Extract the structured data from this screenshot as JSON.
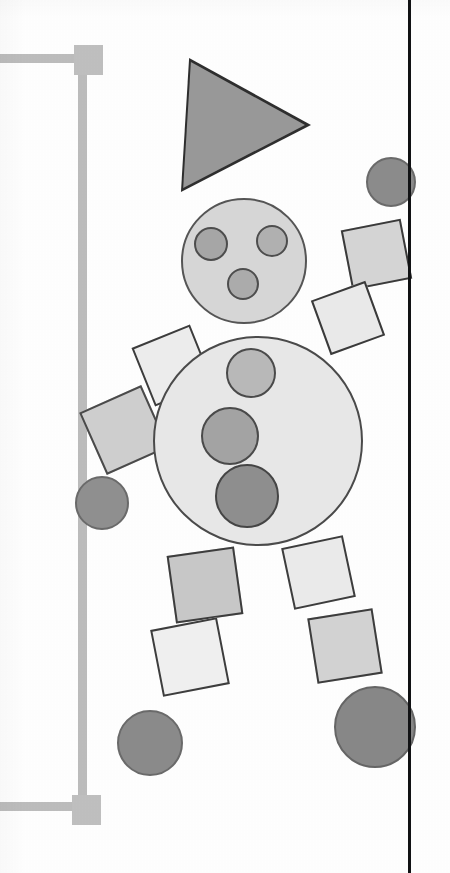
{
  "scene": {
    "title": "Geometric figure composition",
    "background_color": "#ffffff",
    "width": 450,
    "height": 873,
    "medium": "scanned line drawing"
  },
  "palette": {
    "paper": "#ffffff",
    "ink_black": "#111214",
    "outline_dark": "#3a3a3a",
    "outline_mid": "#5c5c5c",
    "gray_bracket": "#bdbdbd",
    "gray_lightest": "#eeeeee",
    "gray_light": "#e3e3e3",
    "gray_pale": "#d8d8d8",
    "gray_mid": "#c9c9c9",
    "gray_medium": "#b5b5b5",
    "gray_dark": "#9a9a9a",
    "gray_darker": "#8e8e8e",
    "gray_darkest": "#848484"
  },
  "vertical_rule": {
    "label": "page-margin-rule",
    "x": 408,
    "y": 0,
    "width": 3,
    "height": 873,
    "color": "#111214"
  },
  "bracket": {
    "label": "left-measurement-bracket",
    "color": "#bdbdbd",
    "bar_thickness": 9,
    "members": [
      {
        "name": "top-arm",
        "x": 0,
        "y": 54,
        "w": 84,
        "h": 9
      },
      {
        "name": "vertical",
        "x": 78,
        "y": 58,
        "w": 9,
        "h": 748
      },
      {
        "name": "bottom-arm",
        "x": 0,
        "y": 802,
        "w": 84,
        "h": 9
      }
    ],
    "nodes": [
      {
        "name": "top-corner-node",
        "x": 74,
        "y": 45,
        "w": 29,
        "h": 30
      },
      {
        "name": "bottom-corner-node",
        "x": 72,
        "y": 795,
        "w": 29,
        "h": 30
      }
    ]
  },
  "figure": {
    "label": "shape-person",
    "parts": {
      "hat": {
        "name": "triangle-hat",
        "kind": "triangle",
        "orientation": "points-right",
        "fill": "#989898",
        "stroke": "#2e2e2e",
        "apex": {
          "x": 311,
          "y": 154
        },
        "top_left": {
          "x": 193,
          "y": 58
        },
        "bottom_left": {
          "x": 185,
          "y": 193
        }
      },
      "head": {
        "name": "head-circle",
        "kind": "circle",
        "fill": "#d6d6d6",
        "stroke": "#555555",
        "cx": 244,
        "cy": 261,
        "r": 63
      },
      "face_dots": [
        {
          "name": "face-dot-left",
          "cx": 211,
          "cy": 244,
          "r": 17,
          "fill": "#a6a6a6",
          "stroke": "#4d4d4d"
        },
        {
          "name": "face-dot-right",
          "cx": 272,
          "cy": 241,
          "r": 16,
          "fill": "#b0b0b0",
          "stroke": "#4d4d4d"
        },
        {
          "name": "face-dot-lower",
          "cx": 243,
          "cy": 284,
          "r": 16,
          "fill": "#ababab",
          "stroke": "#4d4d4d"
        }
      ],
      "body": {
        "name": "body-circle",
        "kind": "circle",
        "fill": "#e7e7e7",
        "stroke": "#4a4a4a",
        "cx": 258,
        "cy": 441,
        "r": 105
      },
      "body_buttons": [
        {
          "name": "body-button-top",
          "cx": 251,
          "cy": 373,
          "r": 25,
          "fill": "#b8b8b8",
          "stroke": "#4a4a4a"
        },
        {
          "name": "body-button-middle",
          "cx": 230,
          "cy": 436,
          "r": 29,
          "fill": "#a3a3a3",
          "stroke": "#4a4a4a"
        },
        {
          "name": "body-button-bottom",
          "cx": 247,
          "cy": 496,
          "r": 32,
          "fill": "#8e8e8e",
          "stroke": "#454545"
        }
      ],
      "left_arm": [
        {
          "name": "left-arm-upper-square",
          "kind": "square",
          "cx": 172,
          "cy": 365,
          "size": 63,
          "rotation": -22,
          "fill": "#ececec",
          "stroke": "#3c3c3c"
        },
        {
          "name": "left-arm-lower-square",
          "kind": "square",
          "cx": 124,
          "cy": 430,
          "size": 68,
          "rotation": -24,
          "fill": "#cecece",
          "stroke": "#4a4a4a"
        },
        {
          "name": "left-hand-circle",
          "kind": "circle",
          "cx": 102,
          "cy": 503,
          "r": 27,
          "fill": "#8f8f8f",
          "stroke": "#6a6a6a"
        }
      ],
      "right_arm": [
        {
          "name": "right-hand-circle",
          "kind": "circle",
          "cx": 391,
          "cy": 182,
          "r": 25,
          "fill": "#8b8b8b",
          "stroke": "#6a6a6a"
        },
        {
          "name": "right-arm-upper-square",
          "kind": "square",
          "cx": 376,
          "cy": 254,
          "size": 61,
          "rotation": -11,
          "fill": "#d4d4d4",
          "stroke": "#3a3a3a"
        },
        {
          "name": "right-arm-lower-square",
          "kind": "square",
          "cx": 348,
          "cy": 318,
          "size": 58,
          "rotation": -20,
          "fill": "#e9e9e9",
          "stroke": "#3a3a3a"
        }
      ],
      "left_leg": [
        {
          "name": "left-leg-upper-square",
          "kind": "square",
          "cx": 205,
          "cy": 585,
          "size": 68,
          "rotation": -8,
          "fill": "#c7c7c7",
          "stroke": "#3d3d3d"
        },
        {
          "name": "left-leg-lower-square",
          "kind": "square",
          "cx": 190,
          "cy": 657,
          "size": 68,
          "rotation": -11,
          "fill": "#efefef",
          "stroke": "#3d3d3d"
        },
        {
          "name": "left-foot-circle",
          "kind": "circle",
          "cx": 150,
          "cy": 743,
          "r": 33,
          "fill": "#8a8a8a",
          "stroke": "#6a6a6a"
        }
      ],
      "right_leg": [
        {
          "name": "right-leg-upper-square",
          "kind": "square",
          "cx": 318,
          "cy": 572,
          "size": 63,
          "rotation": -12,
          "fill": "#eaeaea",
          "stroke": "#3d3d3d"
        },
        {
          "name": "right-leg-lower-square",
          "kind": "square",
          "cx": 345,
          "cy": 646,
          "size": 66,
          "rotation": -9,
          "fill": "#d2d2d2",
          "stroke": "#3d3d3d"
        },
        {
          "name": "right-foot-circle",
          "kind": "circle",
          "cx": 375,
          "cy": 727,
          "r": 41,
          "fill": "#878787",
          "stroke": "#656565"
        }
      ]
    }
  }
}
